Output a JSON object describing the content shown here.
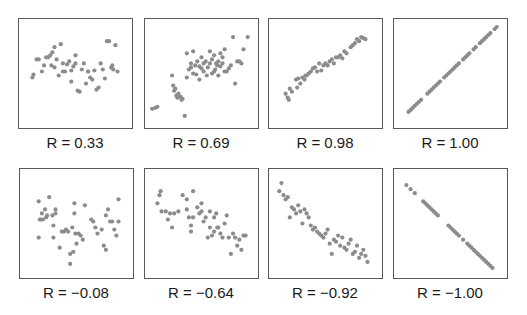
{
  "figure": {
    "point_color": "#8c8c8c",
    "border_color": "#5a5a5a",
    "panels": [
      {
        "label": "R = 0.33"
      },
      {
        "label": "R = 0.69"
      },
      {
        "label": "R = 0.98"
      },
      {
        "label": "R = 1.00"
      },
      {
        "label": "R = −0.08"
      },
      {
        "label": "R = −0.64"
      },
      {
        "label": "R = −0.92"
      },
      {
        "label": "R = −1.00"
      }
    ]
  },
  "chart_data": [
    {
      "type": "scatter",
      "title": "R = 0.33",
      "correlation": 0.33,
      "xlabel": "",
      "ylabel": "",
      "grid": false,
      "x": [
        9,
        10,
        13,
        15,
        18,
        20,
        22,
        24,
        26,
        27,
        28,
        30,
        30,
        32,
        34,
        36,
        38,
        38,
        40,
        42,
        44,
        46,
        46,
        48,
        50,
        50,
        52,
        54,
        56,
        58,
        60,
        62,
        62,
        64,
        66,
        68,
        70,
        72,
        74,
        76,
        78,
        80,
        82,
        84,
        85,
        86,
        88,
        90
      ],
      "y": [
        46,
        49,
        64,
        64,
        52,
        58,
        66,
        66,
        68,
        58,
        71,
        56,
        76,
        64,
        48,
        79,
        52,
        60,
        52,
        59,
        62,
        42,
        53,
        57,
        60,
        68,
        33,
        32,
        54,
        60,
        40,
        52,
        52,
        46,
        44,
        53,
        34,
        36,
        60,
        54,
        45,
        82,
        82,
        56,
        58,
        54,
        78,
        52
      ]
    },
    {
      "type": "scatter",
      "title": "R = 0.69",
      "correlation": 0.69,
      "xlabel": "",
      "ylabel": "",
      "grid": false,
      "x": [
        3,
        6,
        8,
        22,
        23,
        24,
        25,
        26,
        27,
        28,
        30,
        31,
        32,
        34,
        36,
        36,
        38,
        40,
        40,
        42,
        42,
        44,
        45,
        46,
        48,
        48,
        50,
        50,
        52,
        52,
        54,
        55,
        56,
        58,
        58,
        60,
        60,
        62,
        62,
        63,
        64,
        65,
        66,
        66,
        68,
        68,
        70,
        70,
        72,
        72,
        74,
        76,
        78,
        80,
        82,
        84,
        86,
        88,
        90,
        94
      ],
      "y": [
        15,
        16,
        17,
        48,
        38,
        33,
        35,
        28,
        26,
        30,
        27,
        24,
        25,
        8,
        70,
        46,
        54,
        60,
        56,
        50,
        72,
        58,
        49,
        62,
        44,
        57,
        55,
        66,
        52,
        60,
        62,
        48,
        56,
        60,
        72,
        50,
        64,
        68,
        52,
        54,
        60,
        58,
        48,
        62,
        70,
        57,
        60,
        66,
        52,
        74,
        52,
        55,
        58,
        86,
        40,
        62,
        62,
        60,
        74,
        86
      ],
      "note": "dense cluster around (55-75, 50-65)"
    },
    {
      "type": "scatter",
      "title": "R = 0.98",
      "correlation": 0.98,
      "xlabel": "",
      "ylabel": "",
      "grid": false,
      "x": [
        12,
        14,
        15,
        16,
        18,
        22,
        23,
        24,
        26,
        28,
        30,
        31,
        32,
        34,
        36,
        38,
        40,
        42,
        44,
        46,
        48,
        50,
        52,
        54,
        56,
        58,
        60,
        62,
        64,
        66,
        68,
        70,
        74,
        76,
        78,
        80,
        82,
        84,
        86,
        88
      ],
      "y": [
        30,
        26,
        24,
        35,
        32,
        44,
        36,
        45,
        40,
        46,
        44,
        48,
        48,
        50,
        52,
        55,
        56,
        52,
        60,
        53,
        58,
        60,
        58,
        62,
        64,
        60,
        66,
        66,
        68,
        65,
        72,
        70,
        76,
        78,
        80,
        84,
        82,
        86,
        85,
        84
      ]
    },
    {
      "type": "scatter",
      "title": "R = 1.00",
      "correlation": 1.0,
      "xlabel": "",
      "ylabel": "",
      "grid": false,
      "x": [
        10,
        12,
        14,
        16,
        18,
        20,
        22,
        28,
        30,
        32,
        34,
        36,
        38,
        40,
        44,
        46,
        48,
        50,
        52,
        54,
        56,
        58,
        62,
        64,
        66,
        68,
        72,
        74,
        78,
        80,
        82,
        84,
        86,
        88,
        92,
        94
      ],
      "y": [
        12,
        14,
        16,
        18,
        20,
        22,
        24,
        30,
        32,
        34,
        36,
        38,
        40,
        42,
        46,
        48,
        50,
        52,
        54,
        56,
        58,
        60,
        64,
        66,
        68,
        70,
        74,
        76,
        80,
        82,
        84,
        86,
        88,
        90,
        94,
        96
      ]
    },
    {
      "type": "scatter",
      "title": "R = −0.08",
      "correlation": -0.08,
      "xlabel": "",
      "ylabel": "",
      "grid": false,
      "x": [
        14,
        14,
        15,
        16,
        17,
        18,
        20,
        21,
        22,
        24,
        27,
        28,
        28,
        30,
        30,
        34,
        36,
        38,
        40,
        42,
        44,
        44,
        46,
        47,
        48,
        48,
        49,
        50,
        52,
        54,
        56,
        58,
        64,
        66,
        68,
        70,
        74,
        76,
        78,
        78,
        80,
        82,
        84,
        86,
        88,
        90,
        90
      ],
      "y": [
        72,
        36,
        54,
        54,
        60,
        54,
        64,
        56,
        58,
        76,
        58,
        48,
        36,
        60,
        64,
        26,
        42,
        42,
        44,
        42,
        20,
        10,
        46,
        22,
        70,
        60,
        40,
        30,
        40,
        38,
        34,
        68,
        54,
        52,
        46,
        40,
        44,
        28,
        24,
        58,
        64,
        52,
        52,
        44,
        38,
        52,
        74
      ]
    },
    {
      "type": "scatter",
      "title": "R = −0.64",
      "correlation": -0.64,
      "xlabel": "",
      "ylabel": "",
      "grid": false,
      "x": [
        8,
        10,
        11,
        12,
        16,
        18,
        20,
        22,
        24,
        28,
        32,
        36,
        36,
        38,
        40,
        40,
        42,
        42,
        46,
        48,
        50,
        50,
        52,
        54,
        56,
        58,
        58,
        60,
        62,
        62,
        64,
        65,
        66,
        68,
        70,
        72,
        74,
        76,
        78,
        80,
        82,
        84,
        86,
        88,
        90,
        92
      ],
      "y": [
        70,
        78,
        82,
        62,
        62,
        54,
        60,
        46,
        60,
        62,
        78,
        74,
        64,
        56,
        48,
        42,
        82,
        56,
        66,
        60,
        70,
        62,
        52,
        56,
        36,
        46,
        62,
        38,
        42,
        56,
        60,
        46,
        46,
        40,
        36,
        50,
        58,
        36,
        20,
        40,
        36,
        28,
        34,
        24,
        38,
        38
      ]
    },
    {
      "type": "scatter",
      "title": "R = −0.92",
      "correlation": -0.92,
      "xlabel": "",
      "ylabel": "",
      "grid": false,
      "x": [
        6,
        8,
        10,
        12,
        14,
        16,
        18,
        20,
        22,
        24,
        26,
        28,
        30,
        32,
        34,
        36,
        38,
        40,
        42,
        44,
        46,
        48,
        50,
        52,
        54,
        56,
        58,
        60,
        62,
        64,
        66,
        68,
        70,
        72,
        74,
        76,
        78,
        80,
        82,
        84,
        86,
        88,
        90
      ],
      "y": [
        82,
        90,
        78,
        74,
        76,
        56,
        66,
        64,
        60,
        68,
        62,
        50,
        64,
        60,
        56,
        48,
        44,
        46,
        42,
        40,
        38,
        36,
        40,
        44,
        30,
        20,
        34,
        32,
        38,
        28,
        36,
        26,
        24,
        30,
        34,
        20,
        22,
        28,
        16,
        20,
        24,
        18,
        12
      ]
    },
    {
      "type": "scatter",
      "title": "R = −1.00",
      "correlation": -1.0,
      "xlabel": "",
      "ylabel": "",
      "grid": false,
      "x": [
        8,
        12,
        16,
        24,
        26,
        28,
        30,
        32,
        34,
        36,
        38,
        48,
        50,
        52,
        54,
        56,
        58,
        62,
        66,
        68,
        70,
        72,
        74,
        76,
        78,
        80,
        82,
        84,
        86,
        88,
        90
      ],
      "y": [
        88,
        84,
        80,
        72,
        70,
        68,
        66,
        64,
        62,
        60,
        58,
        48,
        46,
        44,
        42,
        40,
        38,
        34,
        30,
        28,
        26,
        24,
        22,
        20,
        18,
        16,
        14,
        12,
        10,
        8,
        6
      ]
    }
  ]
}
